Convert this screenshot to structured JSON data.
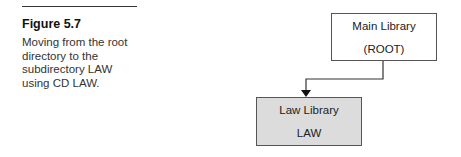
{
  "figure": {
    "label": "Figure 5.7",
    "caption": "Moving from the root directory to the subdirectory LAW using CD LAW."
  },
  "diagram": {
    "nodes": [
      {
        "id": "root",
        "title": "Main Library",
        "subtitle": "(ROOT)",
        "fill": "#ffffff"
      },
      {
        "id": "law",
        "title": "Law Library",
        "subtitle": "LAW",
        "fill": "#dcdcdc"
      }
    ],
    "edges": [
      {
        "from": "root",
        "to": "law",
        "style": "elbow-arrow"
      }
    ]
  }
}
